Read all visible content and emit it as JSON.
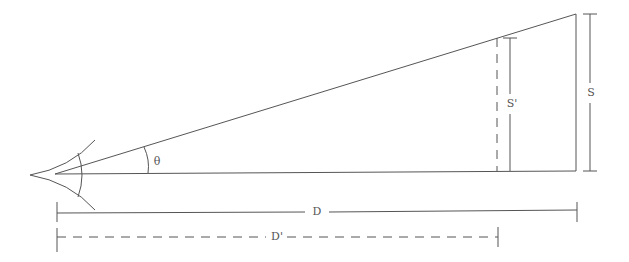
{
  "diagram": {
    "type": "visual-angle-geometry",
    "stroke_color": "#555555",
    "background": "#ffffff",
    "labels": {
      "theta": "θ",
      "size": "S",
      "size_prime": "S'",
      "distance": "D",
      "distance_prime": "D'"
    },
    "nodes": [
      {
        "id": "eye",
        "label": "eye"
      },
      {
        "id": "object_far",
        "label": "S"
      },
      {
        "id": "object_near",
        "label": "S'"
      }
    ],
    "edges": [
      {
        "from": "eye",
        "to": "object_far",
        "label": "D"
      },
      {
        "from": "eye",
        "to": "object_near",
        "label": "D'"
      }
    ]
  }
}
